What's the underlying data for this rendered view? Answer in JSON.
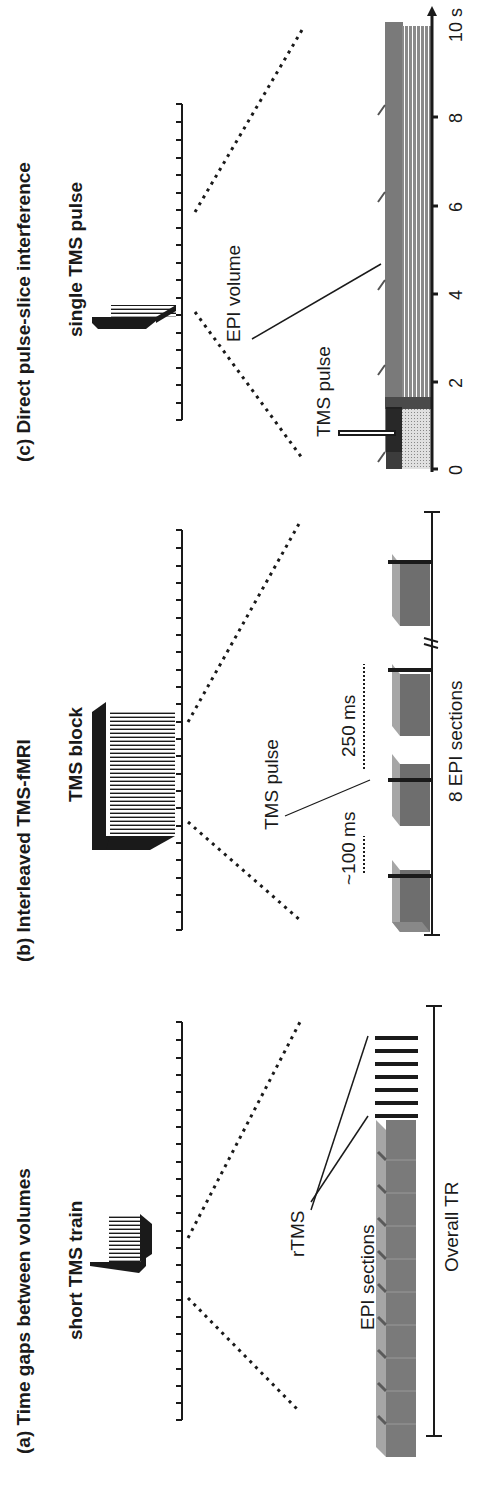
{
  "panels": [
    {
      "id": "a",
      "title": "(a) Time gaps between volumes",
      "stimulus_label": "short TMS train",
      "labels": {
        "rtms": "rTMS",
        "epi": "EPI sections",
        "tr": "Overall TR"
      }
    },
    {
      "id": "b",
      "title": "(b) Interleaved TMS-fMRI",
      "stimulus_label": "TMS block",
      "labels": {
        "pulse": "TMS pulse",
        "gap1": "~100 ms",
        "gap2": "250 ms",
        "epi": "8 EPI sections"
      }
    },
    {
      "id": "c",
      "title": "(c) Direct pulse-slice interference",
      "stimulus_label": "single TMS pulse",
      "labels": {
        "epi": "EPI volume",
        "pulse": "TMS pulse"
      },
      "axis_ticks": [
        "0",
        "2",
        "4",
        "6",
        "8",
        "10 s"
      ]
    }
  ],
  "colors": {
    "ink": "#1a1a1a",
    "epi_light": "#9a9a9a",
    "epi_dark": "#6e6e6e",
    "pulse_fill": "#c8c8c8"
  }
}
